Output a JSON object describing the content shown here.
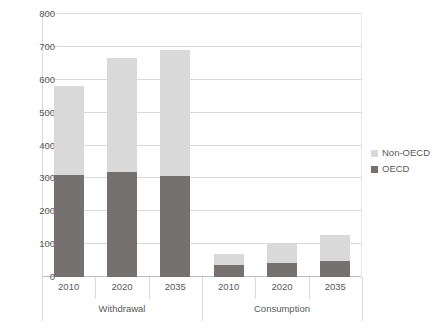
{
  "chart_data": {
    "type": "bar",
    "stacked": true,
    "title": "",
    "subtitle": "",
    "xlabel": "",
    "ylabel": "",
    "ylim": [
      0,
      800
    ],
    "y_ticks": [
      0,
      100,
      200,
      300,
      400,
      500,
      600,
      700,
      800
    ],
    "grid": true,
    "legend_position": "right",
    "groups": [
      {
        "name": "Withdrawal",
        "categories": [
          "2010",
          "2020",
          "2035"
        ]
      },
      {
        "name": "Consumption",
        "categories": [
          "2010",
          "2020",
          "2035"
        ]
      }
    ],
    "categories": [
      "2010",
      "2020",
      "2035",
      "2010",
      "2020",
      "2035"
    ],
    "series": [
      {
        "name": "OECD",
        "color": "#767171",
        "values": [
          310,
          318,
          308,
          38,
          42,
          50
        ]
      },
      {
        "name": "Non-OECD",
        "color": "#d9d9d9",
        "values": [
          270,
          347,
          382,
          32,
          58,
          78
        ]
      }
    ],
    "totals": [
      580,
      665,
      690,
      70,
      100,
      128
    ]
  },
  "axis": {
    "y_tick_labels": [
      "800",
      "700",
      "600",
      "500",
      "400",
      "300",
      "200",
      "100",
      "0"
    ]
  },
  "legend": {
    "items": [
      {
        "label": "Non-OECD",
        "color": "#d9d9d9"
      },
      {
        "label": "OECD",
        "color": "#767171"
      }
    ]
  },
  "colors": {
    "oecd": "#767171",
    "non_oecd": "#d9d9d9",
    "gridline": "#d9d9d9",
    "text": "#595959",
    "background": "#ffffff"
  }
}
